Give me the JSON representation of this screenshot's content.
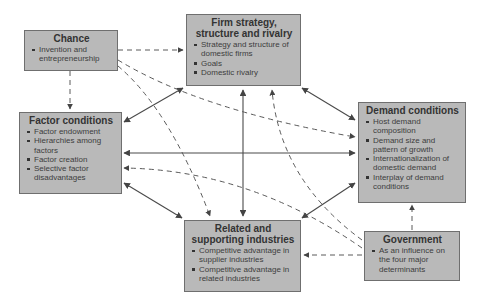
{
  "diagram": {
    "type": "Porter's Diamond",
    "nodes": {
      "chance": {
        "title": "Chance",
        "items": [
          "Invention and entrepreneurship"
        ]
      },
      "firm": {
        "title": "Firm strategy, structure and rivalry",
        "items": [
          "Strategy and structure of domestic firms",
          "Goals",
          "Domestic rivalry"
        ]
      },
      "factor": {
        "title": "Factor conditions",
        "items": [
          "Factor endowment",
          "Hierarchies among factors",
          "Factor creation",
          "Selective factor disadvantages"
        ]
      },
      "demand": {
        "title": "Demand conditions",
        "items": [
          "Host demand composition",
          "Demand size and pattern of growth",
          "Internationalization of domestic demand",
          "Interplay of demand conditions"
        ]
      },
      "related": {
        "title": "Related and supporting industries",
        "items": [
          "Competitive advantage in supplier industries",
          "Competitive advantage in related industries"
        ]
      },
      "government": {
        "title": "Government",
        "items": [
          "As an influence on the four major determinants"
        ]
      }
    },
    "edges": [
      {
        "from": "firm",
        "to": "factor",
        "style": "solid",
        "direction": "both"
      },
      {
        "from": "firm",
        "to": "demand",
        "style": "solid",
        "direction": "both"
      },
      {
        "from": "factor",
        "to": "demand",
        "style": "solid",
        "direction": "both"
      },
      {
        "from": "firm",
        "to": "related",
        "style": "solid",
        "direction": "both"
      },
      {
        "from": "factor",
        "to": "related",
        "style": "solid",
        "direction": "both"
      },
      {
        "from": "demand",
        "to": "related",
        "style": "solid",
        "direction": "both"
      },
      {
        "from": "chance",
        "to": "firm",
        "style": "dashed",
        "direction": "forward"
      },
      {
        "from": "chance",
        "to": "factor",
        "style": "dashed",
        "direction": "forward"
      },
      {
        "from": "chance",
        "to": "demand",
        "style": "dashed",
        "direction": "forward"
      },
      {
        "from": "chance",
        "to": "related",
        "style": "dashed",
        "direction": "forward"
      },
      {
        "from": "government",
        "to": "firm",
        "style": "dashed",
        "direction": "forward"
      },
      {
        "from": "government",
        "to": "factor",
        "style": "dashed",
        "direction": "forward"
      },
      {
        "from": "government",
        "to": "demand",
        "style": "dashed",
        "direction": "forward"
      },
      {
        "from": "government",
        "to": "related",
        "style": "dashed",
        "direction": "forward"
      }
    ],
    "colors": {
      "box_fill": "#b9b9b9",
      "box_border": "#6f6f6f",
      "line": "#4a4a4a"
    }
  }
}
